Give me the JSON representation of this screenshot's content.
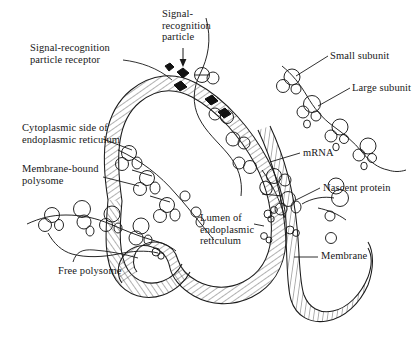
{
  "figure": {
    "ink_color": "#1a1a1a",
    "background_color": "#ffffff",
    "hatch_color": "#3c3c3c"
  },
  "labels": {
    "srp_receptor": "Signal-recognition\nparticle receptor",
    "srp": "Signal-\nrecognition\nparticle",
    "small_subunit": "Small subunit",
    "large_subunit": "Large subunit",
    "cytoplasmic_side": "Cytoplasmic side of\nendoplasmic reticulum",
    "membrane_bound_polysome": "Membrane-bound\npolysome",
    "mrna": "mRNA",
    "nascent_protein": "Nascent protein",
    "lumen": "Lumen of\nendoplasmic\nreticulum",
    "free_polysome": "Free polysome",
    "membrane": "Membrane"
  },
  "elements": {
    "srp_particle_count": 4,
    "membrane_bound_ribosome_count": 8,
    "free_polysome_ribosome_count": 5,
    "cytoplasmic_polysome_ribosome_count": 5,
    "nascent_protein_blob_count": 5
  }
}
